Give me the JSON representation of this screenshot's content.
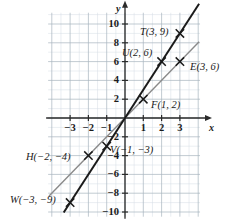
{
  "figure": {
    "kind": "coordinate-plane",
    "axis_labels": {
      "x": "x",
      "y": "y"
    }
  },
  "chart_data": {
    "type": "scatter",
    "title": "",
    "xlabel": "x",
    "ylabel": "y",
    "xlim": [
      -4.2,
      4.1
    ],
    "ylim": [
      -10.5,
      11.2
    ],
    "grid": true,
    "minor_grid": true,
    "legend": "none",
    "xticks": [
      -3,
      -2,
      -1,
      1,
      2,
      3
    ],
    "xticklabels": [
      "-3",
      "-2",
      "-1",
      "1",
      "2",
      "3"
    ],
    "yticks": [
      10,
      8,
      6,
      4,
      2,
      -2,
      -4,
      -6,
      -8,
      -10
    ],
    "yticklabels": [
      "10",
      "8",
      "6",
      "4",
      "2",
      "-2",
      "-4",
      "-6",
      "-8",
      "-10"
    ],
    "series": [
      {
        "name": "y = 3x",
        "type": "line",
        "color": "#1a1a1a",
        "width": 2.0,
        "x": [
          -3.35,
          4.05
        ],
        "y": [
          -10.05,
          12.15
        ],
        "points": [
          {
            "label": "T(3, 9)",
            "x": 3,
            "y": 9,
            "marker": "x"
          },
          {
            "label": "U(2, 6)",
            "x": 2,
            "y": 6,
            "marker": "x"
          },
          {
            "label": "V(-1, -3)",
            "x": -1,
            "y": -3,
            "marker": "x"
          },
          {
            "label": "W(-3, -9)",
            "x": -3,
            "y": -9,
            "marker": "x"
          }
        ]
      },
      {
        "name": "y = 2x",
        "type": "line",
        "color": "#8a8a8a",
        "width": 1.4,
        "x": [
          -4.15,
          4.05
        ],
        "y": [
          -8.3,
          8.1
        ],
        "points": [
          {
            "label": "E(3, 6)",
            "x": 3,
            "y": 6,
            "marker": "x"
          },
          {
            "label": "F(1, 2)",
            "x": 1,
            "y": 2,
            "marker": "x"
          },
          {
            "label": "H(-2, -4)",
            "x": -2,
            "y": -4,
            "marker": "x"
          }
        ]
      }
    ],
    "point_labels": [
      {
        "text": "T(3, 9)",
        "px": 140,
        "py": 27,
        "anchor": "start"
      },
      {
        "text": "U(2, 6)",
        "px": 122,
        "py": 48,
        "anchor": "start"
      },
      {
        "text": "E(3, 6)",
        "px": 190,
        "py": 62,
        "anchor": "start"
      },
      {
        "text": "F(1, 2)",
        "px": 151,
        "py": 100,
        "anchor": "start"
      },
      {
        "text": "V(-1, -3)",
        "px": 110,
        "py": 145,
        "anchor": "start"
      },
      {
        "text": "H(-2, -4)",
        "px": 26,
        "py": 152,
        "anchor": "start"
      },
      {
        "text": "W(-3, -9)",
        "px": 10,
        "py": 195,
        "anchor": "start"
      }
    ],
    "colors": {
      "grid_minor": "#d5dde4",
      "grid_major": "#a8b4bf",
      "axis": "#2b2b2b",
      "line_steep": "#1a1a1a",
      "line_shallow": "#8a8a8a",
      "marker": "#1a1a1a",
      "text": "#1a1a1a",
      "background": "#ffffff"
    }
  }
}
